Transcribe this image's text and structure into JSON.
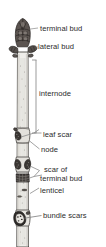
{
  "figure": {
    "background_color": "#ffffff",
    "text_color": "#2b2b2b",
    "line_color": "#7a7a7a",
    "twig_fill": "#efeeea",
    "twig_outline": "#4a4744",
    "bud_fill": "#4a4441",
    "scar_fill": "#3b3734"
  },
  "labels": {
    "terminal_bud": "terminal bud",
    "lateral_bud": "lateral bud",
    "internode": "internode",
    "leaf_scar": "leaf scar",
    "node": "node",
    "scar_of": "scar of",
    "terminal_bud_2": "terminal bud",
    "lenticel": "lenticel",
    "bundle_scars": "bundle scars"
  },
  "parts": {
    "terminal_bud": "terminal-bud-shape",
    "lateral_bud": "lateral-bud-shape",
    "internode_bracket": "internode-bracket-line",
    "leaf_scar": "leaf-scar-shape",
    "node": "node-ring",
    "terminal_bud_scar": "terminal-bud-scar-ring",
    "lenticel": "lenticel-speck",
    "bundle_scars": "bundle-scars-shape",
    "twig_stem": "twig-stem"
  }
}
